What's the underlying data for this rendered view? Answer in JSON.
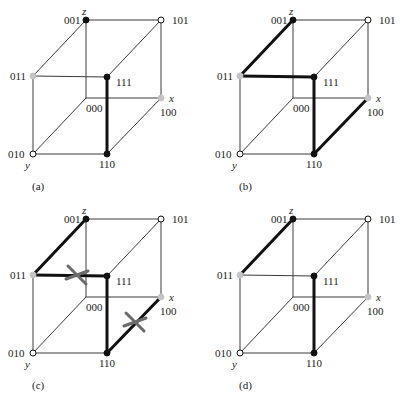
{
  "figure": {
    "panels": [
      {
        "id": "a",
        "caption": "(a)",
        "offset": [
          0,
          0
        ],
        "bold_edges": [
          [
            "111",
            "110"
          ]
        ],
        "crosses": []
      },
      {
        "id": "b",
        "caption": "(b)",
        "offset": [
          207,
          0
        ],
        "bold_edges": [
          [
            "001",
            "011"
          ],
          [
            "011",
            "111"
          ],
          [
            "111",
            "110"
          ],
          [
            "110",
            "100"
          ]
        ],
        "crosses": []
      },
      {
        "id": "c",
        "caption": "(c)",
        "offset": [
          0,
          199
        ],
        "bold_edges": [
          [
            "001",
            "011"
          ],
          [
            "011",
            "111"
          ],
          [
            "111",
            "110"
          ],
          [
            "110",
            "100"
          ]
        ],
        "crosses": [
          [
            77,
            76
          ],
          [
            135,
            123
          ]
        ]
      },
      {
        "id": "d",
        "caption": "(d)",
        "offset": [
          207,
          199
        ],
        "bold_edges": [
          [
            "001",
            "011"
          ],
          [
            "111",
            "110"
          ]
        ],
        "crosses": []
      }
    ],
    "vertices": {
      "001": {
        "pos": [
          86,
          20
        ],
        "style": "black",
        "label": "001",
        "label_pos": [
          64,
          24
        ]
      },
      "101": {
        "pos": [
          161,
          20
        ],
        "style": "white",
        "label": "101",
        "label_pos": [
          172,
          24
        ]
      },
      "011": {
        "pos": [
          33,
          76
        ],
        "style": "gray",
        "label": "011",
        "label_pos": [
          10,
          80
        ]
      },
      "111": {
        "pos": [
          107,
          77
        ],
        "style": "black",
        "label": "111",
        "label_pos": [
          116,
          86
        ]
      },
      "000": {
        "pos": [
          86,
          98
        ],
        "style": "none",
        "label": "000",
        "label_pos": [
          86,
          112
        ]
      },
      "100": {
        "pos": [
          161,
          98
        ],
        "style": "gray",
        "label": "100",
        "label_pos": [
          160,
          116
        ]
      },
      "010": {
        "pos": [
          33,
          154
        ],
        "style": "white",
        "label": "010",
        "label_pos": [
          8,
          158
        ]
      },
      "110": {
        "pos": [
          107,
          154
        ],
        "style": "black",
        "label": "110",
        "label_pos": [
          99,
          168
        ]
      }
    },
    "edges": [
      [
        "001",
        "101"
      ],
      [
        "001",
        "011"
      ],
      [
        "001",
        "000"
      ],
      [
        "101",
        "111"
      ],
      [
        "101",
        "100"
      ],
      [
        "011",
        "111"
      ],
      [
        "011",
        "010"
      ],
      [
        "111",
        "110"
      ],
      [
        "000",
        "100"
      ],
      [
        "000",
        "010"
      ],
      [
        "100",
        "110"
      ],
      [
        "010",
        "110"
      ]
    ],
    "axis_labels": [
      {
        "text": "z",
        "pos": [
          82,
          15
        ]
      },
      {
        "text": "x",
        "pos": [
          169,
          102
        ]
      },
      {
        "text": "y",
        "pos": [
          25,
          169
        ]
      }
    ],
    "caption_pos": [
      32,
      190
    ]
  }
}
